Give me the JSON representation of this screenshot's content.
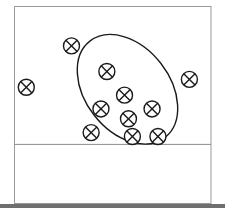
{
  "figure": {
    "marker_symbol": "circled-x",
    "colors": {
      "stroke": "#1a1a1a",
      "frame": "#9a9a9a",
      "baseline": "#8c8c8c",
      "bottom_bar": "#6f6f6f"
    },
    "markers": [
      {
        "id": "m1",
        "x": 0.29,
        "y": 0.8,
        "inside_ellipse": "edge"
      },
      {
        "id": "m2",
        "x": 0.06,
        "y": 0.59,
        "inside_ellipse": false
      },
      {
        "id": "m3",
        "x": 0.47,
        "y": 0.67,
        "inside_ellipse": true
      },
      {
        "id": "m4",
        "x": 0.89,
        "y": 0.63,
        "inside_ellipse": false
      },
      {
        "id": "m5",
        "x": 0.56,
        "y": 0.55,
        "inside_ellipse": true
      },
      {
        "id": "m6",
        "x": 0.44,
        "y": 0.48,
        "inside_ellipse": true
      },
      {
        "id": "m7",
        "x": 0.7,
        "y": 0.48,
        "inside_ellipse": true
      },
      {
        "id": "m8",
        "x": 0.58,
        "y": 0.43,
        "inside_ellipse": true
      },
      {
        "id": "m9",
        "x": 0.39,
        "y": 0.36,
        "inside_ellipse": "edge"
      },
      {
        "id": "m10",
        "x": 0.6,
        "y": 0.34,
        "inside_ellipse": true
      },
      {
        "id": "m11",
        "x": 0.73,
        "y": 0.34,
        "inside_ellipse": true
      }
    ],
    "ellipse": {
      "cx": 0.575,
      "cy": 0.58,
      "rx": 0.215,
      "ry": 0.31,
      "rotation_deg": -38
    },
    "baseline_y": 0.3
  },
  "caption": {
    "text": "",
    "note": "caption cut off at image bottom, illegible"
  }
}
